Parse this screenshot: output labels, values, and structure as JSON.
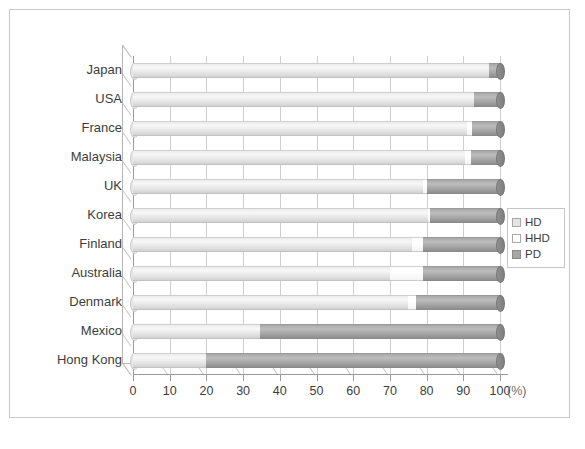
{
  "chart_data": {
    "type": "bar",
    "orientation": "horizontal",
    "stacked": true,
    "title": "",
    "xlabel": "(%)",
    "ylabel": "",
    "xlim": [
      0,
      100
    ],
    "xticks": [
      0,
      10,
      20,
      30,
      40,
      50,
      60,
      70,
      80,
      90,
      100
    ],
    "xtick_labels": [
      "0",
      "10",
      "20",
      "30",
      "40",
      "50",
      "60",
      "70",
      "80",
      "90",
      "100"
    ],
    "unit_label": "(%)",
    "grid": true,
    "legend_position": "right",
    "categories": [
      "Japan",
      "USA",
      "France",
      "Malaysia",
      "UK",
      "Korea",
      "Finland",
      "Australia",
      "Denmark",
      "Mexico",
      "Hong Kong"
    ],
    "series": [
      {
        "name": "HD",
        "color": "#e6e6e6",
        "values": [
          97,
          93,
          91,
          90.5,
          79,
          80.5,
          76,
          70,
          75,
          34.5,
          20
        ]
      },
      {
        "name": "HHD",
        "color": "#ffffff",
        "values": [
          0,
          0,
          1.5,
          1.5,
          1,
          0.5,
          3,
          9,
          2,
          0,
          0
        ]
      },
      {
        "name": "PD",
        "color": "#a6a6a6",
        "values": [
          3,
          7,
          7.5,
          8,
          20,
          19,
          21,
          21,
          23,
          65.5,
          80
        ]
      }
    ],
    "legend": [
      {
        "label": "HD",
        "swatch": "light-gray"
      },
      {
        "label": "HHD",
        "swatch": "white"
      },
      {
        "label": "PD",
        "swatch": "medium-gray"
      }
    ]
  },
  "colors": {
    "hd": "#e6e6e6",
    "hhd": "#ffffff",
    "pd": "#a6a6a6",
    "axis": "#9a9a9a",
    "grid": "#cfcfcf",
    "frame": "#c9c9c9",
    "text": "#3d3d3d"
  }
}
